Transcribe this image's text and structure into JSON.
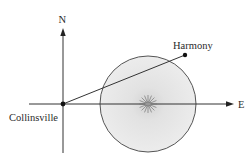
{
  "diagram": {
    "axes": {
      "north_label": "N",
      "east_label": "E"
    },
    "points": [
      {
        "name": "Collinsville",
        "label": "Collinsville",
        "role": "origin"
      },
      {
        "name": "Harmony",
        "label": "Harmony",
        "role": "destination"
      }
    ],
    "storm": {
      "shape": "circle",
      "center_marker": "storm-burst-icon",
      "fill_color": "#e4e4e4",
      "edge_color": "#555555"
    },
    "colors": {
      "line": "#333333",
      "point": "#111111",
      "text": "#2a2a2a"
    }
  }
}
